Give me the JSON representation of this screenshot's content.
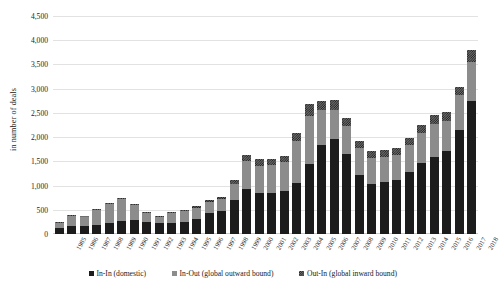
{
  "chart_data": {
    "type": "bar",
    "stacked": true,
    "title": "",
    "xlabel": "",
    "ylabel": "in number of deals",
    "ylim": [
      0,
      4500
    ],
    "ytick_step": 500,
    "yticks": [
      "0",
      "500",
      "1,000",
      "1,500",
      "2,000",
      "2,500",
      "3,000",
      "3,500",
      "4,000",
      "4,500"
    ],
    "grid": true,
    "legend_position": "bottom",
    "categories": [
      "1985",
      "1986",
      "1987",
      "1988",
      "1989",
      "1990",
      "1991",
      "1992",
      "1993",
      "1994",
      "1995",
      "1996",
      "1997",
      "1998",
      "1999",
      "2000",
      "2001",
      "2002",
      "2003",
      "2004",
      "2005",
      "2006",
      "2007",
      "2008",
      "2009",
      "2010",
      "2011",
      "2012",
      "2013",
      "2014",
      "2015",
      "2016",
      "2017",
      "2018"
    ],
    "series": [
      {
        "name": "In-In (domestic)",
        "color": "#1c1c1c",
        "values": [
          120,
          175,
          175,
          195,
          235,
          265,
          290,
          240,
          225,
          235,
          240,
          300,
          440,
          465,
          700,
          920,
          850,
          840,
          880,
          1050,
          1440,
          1840,
          1960,
          1650,
          1220,
          1030,
          1080,
          1120,
          1270,
          1470,
          1600,
          1720,
          2140,
          2750
        ]
      },
      {
        "name": "In-Out (global outward bound)",
        "color": "#8c8c8c",
        "values": [
          115,
          205,
          190,
          300,
          375,
          460,
          300,
          195,
          125,
          195,
          225,
          240,
          230,
          255,
          330,
          580,
          560,
          590,
          600,
          870,
          1000,
          720,
          600,
          580,
          560,
          540,
          520,
          520,
          560,
          620,
          680,
          620,
          720,
          800
        ]
      },
      {
        "name": "Out-In (global inward bound)",
        "color": "#6f6f6f",
        "pattern": "checkerboard",
        "values": [
          10,
          15,
          15,
          20,
          25,
          25,
          25,
          25,
          20,
          25,
          35,
          30,
          40,
          50,
          80,
          130,
          130,
          120,
          130,
          160,
          250,
          180,
          200,
          160,
          140,
          150,
          130,
          130,
          150,
          160,
          170,
          170,
          180,
          250
        ]
      }
    ]
  }
}
